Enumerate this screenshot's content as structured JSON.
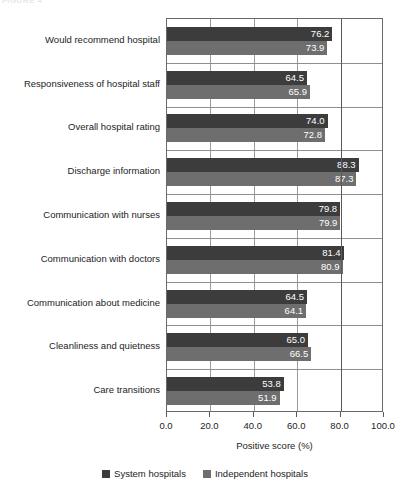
{
  "figure": {
    "caption": "FIGURE 4",
    "background": "#ffffff"
  },
  "chart_data": {
    "type": "bar",
    "orientation": "horizontal",
    "title": "",
    "subtitle": "",
    "xlabel": "Positive score (%)",
    "ylabel": "",
    "xlim": [
      0.0,
      100.0
    ],
    "xticks": [
      "0.0",
      "20.0",
      "40.0",
      "60.0",
      "80.0",
      "100.0"
    ],
    "xtick_values": [
      0.0,
      20.0,
      40.0,
      60.0,
      80.0,
      100.0
    ],
    "grid": "vertical",
    "grid_major_at": 80.0,
    "legend_position": "bottom-center",
    "categories": [
      "Would recommend hospital",
      "Responsiveness of hospital staff",
      "Overall hospital rating",
      "Discharge information",
      "Communication with nurses",
      "Communication with doctors",
      "Communication about medicine",
      "Cleanliness and quietness",
      "Care transitions"
    ],
    "series": [
      {
        "name": "System hospitals",
        "color": "#3c3c3c",
        "values": [
          76.2,
          64.5,
          74.0,
          88.3,
          79.8,
          81.4,
          64.5,
          65.0,
          53.8
        ],
        "labels": [
          "76.2",
          "64.5",
          "74.0",
          "88.3",
          "79.8",
          "81.4",
          "64.5",
          "65.0",
          "53.8"
        ]
      },
      {
        "name": "Independent hospitals",
        "color": "#6e6e6e",
        "values": [
          73.9,
          65.9,
          72.8,
          87.3,
          79.9,
          80.9,
          64.1,
          66.5,
          51.9
        ],
        "labels": [
          "73.9",
          "65.9",
          "72.8",
          "87.3",
          "79.9",
          "80.9",
          "64.1",
          "66.5",
          "51.9"
        ]
      }
    ]
  },
  "legend": {
    "items": [
      {
        "label": "System hospitals",
        "color": "#3c3c3c"
      },
      {
        "label": "Independent hospitals",
        "color": "#6e6e6e"
      }
    ]
  }
}
